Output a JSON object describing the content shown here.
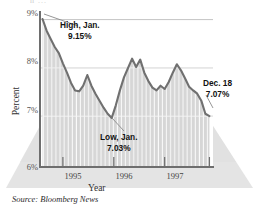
{
  "figure": {
    "cutoff_top_text": "h  ...",
    "source": "Source: Bloomberg News"
  },
  "annotations": {
    "high": {
      "line1": "High, Jan.",
      "line2": "9.15%"
    },
    "low": {
      "line1": "Low, Jan.",
      "line2": "7.03%"
    },
    "last": {
      "line1": "Dec. 18",
      "line2": "7.07%"
    }
  },
  "axis": {
    "y_title": "Percent",
    "x_title": "Year",
    "y_ticks": [
      "9%",
      "8%",
      "7%",
      "6%"
    ],
    "x_ticks": [
      "1995",
      "1996",
      "1997"
    ]
  },
  "colors": {
    "line": "#6b6b6b",
    "fill": "#d9d9d9",
    "stripe": "#ffffff",
    "gridline": "#bfbfbf",
    "axis": "#6e6e6e",
    "floor": "#e2e2e2",
    "text": "#111111"
  },
  "chart_data": {
    "type": "line",
    "title": "",
    "subtitle": "",
    "xlabel": "Year",
    "ylabel": "Percent",
    "ylim": [
      6,
      9.3
    ],
    "xlim": [
      1994.55,
      1997.95
    ],
    "y_tick_values": [
      6,
      7,
      8,
      9
    ],
    "y_tick_labels": [
      "6%",
      "7%",
      "8%",
      "9%"
    ],
    "x_tick_values": [
      1995,
      1996,
      1997
    ],
    "x_tick_labels": [
      "1995",
      "1996",
      "1997"
    ],
    "grid": "horizontal",
    "legend": "none",
    "series": [
      {
        "name": "30-year mortgage rate",
        "x": [
          1994.6,
          1994.68,
          1994.76,
          1994.84,
          1994.92,
          1995.0,
          1995.08,
          1995.16,
          1995.24,
          1995.32,
          1995.4,
          1995.48,
          1995.56,
          1995.64,
          1995.72,
          1995.8,
          1995.88,
          1995.96,
          1996.04,
          1996.12,
          1996.2,
          1996.28,
          1996.36,
          1996.44,
          1996.52,
          1996.6,
          1996.68,
          1996.76,
          1996.84,
          1996.92,
          1997.0,
          1997.08,
          1997.16,
          1997.24,
          1997.32,
          1997.4,
          1997.48,
          1997.56,
          1997.64,
          1997.72,
          1997.8,
          1997.88
        ],
        "y": [
          9.15,
          8.9,
          8.72,
          8.55,
          8.42,
          8.2,
          8.0,
          7.78,
          7.62,
          7.6,
          7.72,
          7.95,
          7.72,
          7.55,
          7.4,
          7.25,
          7.12,
          7.03,
          7.3,
          7.62,
          7.9,
          8.1,
          8.3,
          8.12,
          8.28,
          8.0,
          7.82,
          7.68,
          7.62,
          7.72,
          7.65,
          7.8,
          8.0,
          8.18,
          8.05,
          7.88,
          7.7,
          7.62,
          7.55,
          7.4,
          7.12,
          7.07
        ]
      }
    ],
    "annotations": [
      {
        "label": "High, Jan.",
        "value": "9.15%",
        "x": 1994.6,
        "y": 9.15
      },
      {
        "label": "Low, Jan.",
        "value": "7.03%",
        "x": 1995.96,
        "y": 7.03
      },
      {
        "label": "Dec. 18",
        "value": "7.07%",
        "x": 1997.88,
        "y": 7.07
      }
    ]
  }
}
